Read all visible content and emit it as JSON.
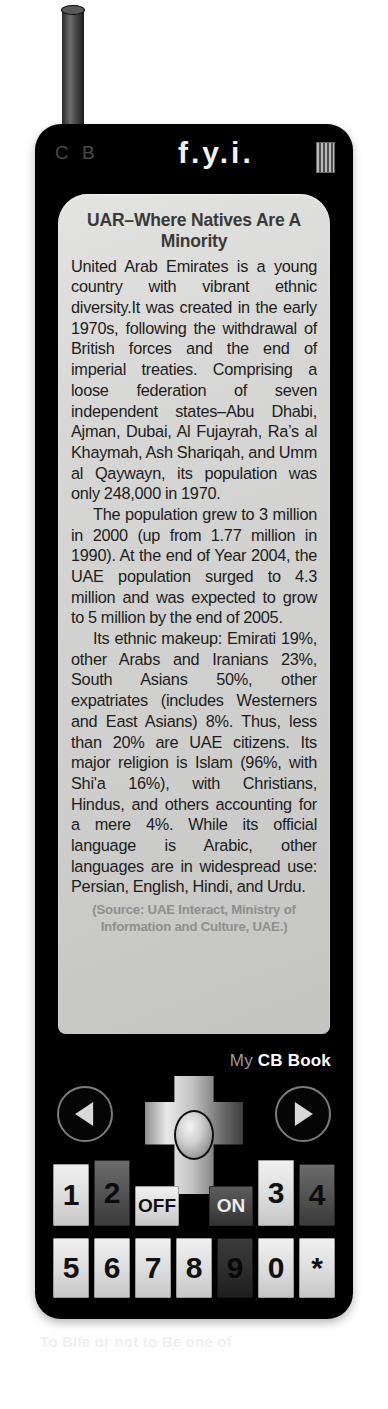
{
  "device": {
    "brand_left": "C B",
    "brand_center": "f.y.i.",
    "speaker_icon": "speaker-grille-icon",
    "footer_brand_thin": "My",
    "footer_brand_bold": "CB Book"
  },
  "screen": {
    "title": "UAR–Where Natives Are A Minority",
    "paragraphs": [
      "United Arab Emirates is a young country with vibrant ethnic diversity.It was created in the early 1970s, following the withdrawal of British forces and the end of imperial treaties. Comprising a loose federation of seven independent states–Abu Dhabi, Ajman, Dubai, Al Fujayrah, Ra’s al Khaymah, Ash Shariqah, and Umm al Qaywayn, its population was only 248,000 in 1970.",
      "The population grew to 3 million in 2000 (up from 1.77 million in 1990). At the end of Year 2004, the UAE population surged to 4.3 million and was expected to grow to 5 million by the end of 2005.",
      "Its ethnic makeup: Emirati 19%, other Arabs and Iranians 23%, South Asians 50%, other expatriates (includes Westerners and East Asians) 8%. Thus, less than 20% are UAE citizens. Its major religion is Islam (96%, with Shi'a 16%), with Christians, Hindus, and others accounting for a mere 4%. While its official language is Arabic, other languages are in widespread use: Persian, English, Hindi, and Urdu."
    ],
    "source": "(Source: UAE Interact, Ministry of Information and Culture, UAE.)"
  },
  "controls": {
    "prev_label": "previous-page",
    "next_label": "next-page",
    "dpad_label": "directional-pad",
    "keys_row1": [
      {
        "label": "1",
        "style": "k-light",
        "pos": "pos-1"
      },
      {
        "label": "2",
        "style": "k-dark",
        "pos": "pos-2"
      },
      {
        "label": "OFF",
        "style": "k-light",
        "pos": "pos-off"
      },
      {
        "label": "ON",
        "style": "k-mid",
        "pos": "pos-on"
      },
      {
        "label": "3",
        "style": "k-light",
        "pos": "pos-3"
      },
      {
        "label": "4",
        "style": "k-dark",
        "pos": "pos-4"
      }
    ],
    "keys_row2": [
      {
        "label": "5",
        "style": "k-light",
        "pos": "b-5"
      },
      {
        "label": "6",
        "style": "k-light",
        "pos": "b-6"
      },
      {
        "label": "7",
        "style": "k-light",
        "pos": "b-7"
      },
      {
        "label": "8",
        "style": "k-light",
        "pos": "b-8"
      },
      {
        "label": "9",
        "style": "k-darker",
        "pos": "b-9"
      },
      {
        "label": "0",
        "style": "k-light",
        "pos": "b-0"
      },
      {
        "label": "*",
        "style": "k-light",
        "pos": "b-s"
      }
    ]
  },
  "background": {
    "bleed_text": "To BIIe or not to Be one of"
  }
}
